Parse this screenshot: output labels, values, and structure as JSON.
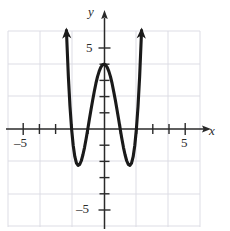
{
  "figure": {
    "kind": "cartesian-graph",
    "width": 230,
    "height": 231,
    "background_color": "#ffffff",
    "curve_color": "#1a1a1a",
    "axis_color": "#2a2a2a",
    "grid_color": "#d8d8e0"
  },
  "axes": {
    "x_label": "x",
    "y_label": "y",
    "x_ticks_labeled": [
      {
        "value": -5,
        "text": "–5"
      },
      {
        "value": 5,
        "text": "5"
      }
    ],
    "y_ticks_labeled": [
      {
        "value": 5,
        "text": "5"
      },
      {
        "value": -5,
        "text": "–5"
      }
    ],
    "origin_px": {
      "x": 104,
      "y": 129
    },
    "unit_px": 16.2,
    "x_range": [
      -6.4,
      7.6
    ],
    "y_range": [
      -6.2,
      7.9
    ],
    "grid": true,
    "grid_step_units": 2,
    "tick_step_units": 1
  },
  "chart_data": {
    "type": "line",
    "title": "",
    "xlabel": "x",
    "ylabel": "y",
    "grid": true,
    "legend": null,
    "xlim": [
      -6.4,
      7.6
    ],
    "ylim": [
      -6.2,
      7.9
    ],
    "xticks": [
      -5,
      -4,
      -3,
      -2,
      -1,
      0,
      1,
      2,
      3,
      4,
      5
    ],
    "yticks": [
      -5,
      -4,
      -3,
      -2,
      -1,
      0,
      1,
      2,
      3,
      4,
      5
    ],
    "xticklabels": [
      "–5",
      "",
      "",
      "",
      "",
      "",
      "",
      "",
      "",
      "",
      "5"
    ],
    "yticklabels": [
      "–5",
      "",
      "",
      "",
      "",
      "",
      "",
      "",
      "",
      "",
      "5"
    ],
    "series": [
      {
        "name": "quartic",
        "equation": "y = x^4 - 5x^2 + 4",
        "style": "solid",
        "color": "#1a1a1a",
        "arrowheads": [
          "start-up",
          "end-up"
        ],
        "features": {
          "local_maximum": {
            "x": 0,
            "y": 4
          },
          "local_minima": [
            {
              "x": -1.58,
              "y": -2.5
            },
            {
              "x": 1.58,
              "y": -2.5
            }
          ],
          "x_intercepts": [
            -2,
            -1,
            1,
            2
          ],
          "y_intercept": 4
        },
        "x": [
          -2.32,
          -2.2,
          -2.1,
          -2.0,
          -1.9,
          -1.8,
          -1.7,
          -1.6,
          -1.5,
          -1.4,
          -1.3,
          -1.2,
          -1.1,
          -1.0,
          -0.9,
          -0.8,
          -0.7,
          -0.6,
          -0.5,
          -0.4,
          -0.3,
          -0.2,
          -0.1,
          0.0,
          0.1,
          0.2,
          0.3,
          0.4,
          0.5,
          0.6,
          0.7,
          0.8,
          0.9,
          1.0,
          1.1,
          1.2,
          1.3,
          1.4,
          1.5,
          1.6,
          1.7,
          1.8,
          1.9,
          2.0,
          2.1,
          2.2,
          2.32
        ],
        "y": [
          6.08,
          3.23,
          1.4,
          0.0,
          -1.02,
          -1.71,
          -2.1,
          -2.25,
          -2.19,
          -1.96,
          -1.59,
          -1.13,
          -0.59,
          0.0,
          0.61,
          1.21,
          1.78,
          2.31,
          2.81,
          3.23,
          3.56,
          3.8,
          3.95,
          4.0,
          3.95,
          3.8,
          3.56,
          3.23,
          2.81,
          2.31,
          1.78,
          1.21,
          0.61,
          0.0,
          -0.59,
          -1.13,
          -1.59,
          -1.96,
          -2.19,
          -2.25,
          -2.1,
          -1.71,
          -1.02,
          0.0,
          1.4,
          3.23,
          6.08
        ]
      }
    ]
  }
}
